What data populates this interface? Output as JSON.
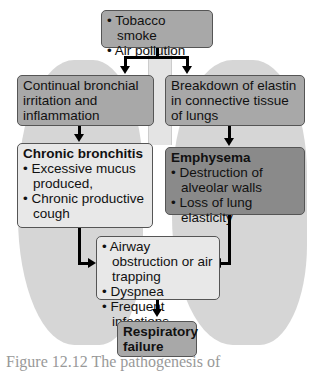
{
  "diagram": {
    "causes": {
      "items": [
        "Tobacco smoke",
        "Air pollution"
      ]
    },
    "left_mechanism": "Continual bronchial irritation and inflammation",
    "right_mechanism": "Breakdown of elastin in connective tissue of lungs",
    "chronic_bronchitis": {
      "title": "Chronic bronchitis",
      "items": [
        "Excessive mucus produced,",
        "Chronic productive cough"
      ]
    },
    "emphysema": {
      "title": "Emphysema",
      "items": [
        "Destruction of alveolar walls",
        "Loss of lung elasticity"
      ]
    },
    "effects": {
      "items": [
        "Airway obstruction or air trapping",
        "Dyspnea",
        "Frequent infections"
      ]
    },
    "outcome": "Respiratory failure",
    "caption": "Figure 12.12 The pathogenesis of"
  }
}
